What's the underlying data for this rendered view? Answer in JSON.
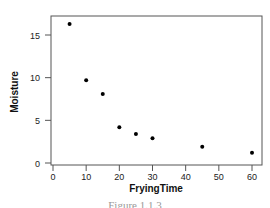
{
  "chart_data": {
    "type": "scatter",
    "title": "",
    "xlabel": "FryingTime",
    "ylabel": "Moisture",
    "x": [
      5,
      10,
      15,
      20,
      25,
      30,
      45,
      60
    ],
    "y": [
      16.3,
      9.7,
      8.1,
      4.2,
      3.4,
      2.9,
      1.9,
      1.2
    ],
    "series": [
      {
        "name": "Moisture",
        "x": [
          5,
          10,
          15,
          20,
          25,
          30,
          45,
          60
        ],
        "y": [
          16.3,
          9.7,
          8.1,
          4.2,
          3.4,
          2.9,
          1.9,
          1.2
        ]
      }
    ],
    "xticks": [
      0,
      10,
      20,
      30,
      40,
      50,
      60
    ],
    "yticks": [
      0,
      5,
      10,
      15
    ],
    "xlim": [
      -1,
      62
    ],
    "ylim": [
      -0.3,
      17.2
    ],
    "grid": false,
    "legend": null,
    "marker_color": "#000000"
  },
  "caption": "Figure 1.1.3"
}
